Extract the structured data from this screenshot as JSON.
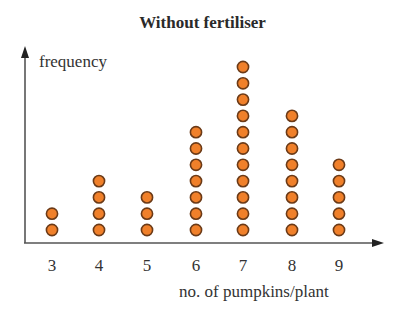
{
  "chart_data": {
    "type": "dot_plot",
    "title": "Without fertiliser",
    "xlabel": "no. of pumpkins/plant",
    "ylabel": "frequency",
    "categories": [
      "3",
      "4",
      "5",
      "6",
      "7",
      "8",
      "9"
    ],
    "values": [
      2,
      4,
      3,
      7,
      11,
      8,
      5
    ],
    "grid": false,
    "legend": null,
    "dot_color": "#f0802a",
    "dot_outline": "#6b3a17",
    "axis_color": "#555555"
  }
}
